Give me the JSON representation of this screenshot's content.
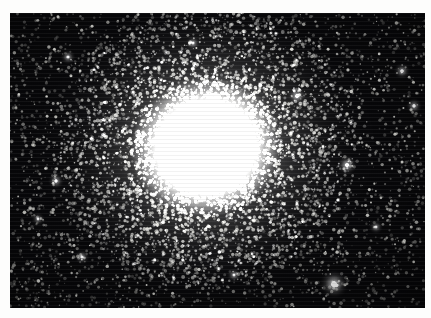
{
  "page": {
    "background_color": "#fdfdfc",
    "caption": ""
  },
  "photo": {
    "name": "globular-cluster-photograph",
    "alt_text": "Photographic plate of a globular star cluster",
    "frame": {
      "x": 10,
      "y": 13,
      "width": 415,
      "height": 295
    },
    "background_color": "#050506",
    "border_color": "#0a0a0b"
  },
  "chart_data": {
    "type": "scatter",
    "title": "",
    "xlabel": "",
    "ylabel": "",
    "grid": false,
    "legend": null,
    "xlim": [
      0,
      415
    ],
    "ylim": [
      0,
      295
    ],
    "core": {
      "center_x": 196,
      "center_y": 134,
      "saturated_radius_x": 40,
      "saturated_radius_y": 44,
      "halo_radius_x": 130,
      "halo_radius_y": 120,
      "peak_color": "#ffffff",
      "halo_color": "#d8d8d4",
      "sky_color": "#08080a",
      "rotation_deg": -14
    },
    "field": {
      "sky_color": "#08080a",
      "star_color": "#f2f2ee",
      "total_field_stars": 3600,
      "total_halo_stars": 5200,
      "size_range_px": [
        0.5,
        2.4
      ]
    },
    "bright_stars": [
      {
        "name": "bright-foreground-star-lower-right",
        "x": 324,
        "y": 271,
        "radius": 3.6,
        "brightness": 1.0
      },
      {
        "name": "bright-star-right-mid",
        "x": 337,
        "y": 152,
        "radius": 2.5,
        "brightness": 0.88
      },
      {
        "name": "bright-star-upper-right",
        "x": 287,
        "y": 83,
        "radius": 2.3,
        "brightness": 0.82
      },
      {
        "name": "bright-star-right-upper",
        "x": 392,
        "y": 58,
        "radius": 2.1,
        "brightness": 0.78
      },
      {
        "name": "bright-star-far-right",
        "x": 404,
        "y": 93,
        "radius": 2.0,
        "brightness": 0.74
      },
      {
        "name": "bright-star-left-mid",
        "x": 46,
        "y": 168,
        "radius": 2.0,
        "brightness": 0.72
      },
      {
        "name": "bright-star-lower-left",
        "x": 72,
        "y": 244,
        "radius": 1.9,
        "brightness": 0.7
      },
      {
        "name": "bright-star-upper-left",
        "x": 58,
        "y": 44,
        "radius": 1.9,
        "brightness": 0.7
      },
      {
        "name": "bright-star-top-center",
        "x": 183,
        "y": 30,
        "radius": 1.8,
        "brightness": 0.66
      },
      {
        "name": "bright-star-bottom-center",
        "x": 224,
        "y": 262,
        "radius": 1.8,
        "brightness": 0.66
      },
      {
        "name": "bright-star-right-lower",
        "x": 366,
        "y": 214,
        "radius": 1.8,
        "brightness": 0.64
      },
      {
        "name": "bright-star-left-lower",
        "x": 28,
        "y": 206,
        "radius": 1.7,
        "brightness": 0.62
      }
    ]
  }
}
